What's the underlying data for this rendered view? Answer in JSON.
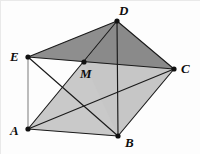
{
  "figure": {
    "width": 200,
    "height": 154,
    "background_color": "#fdfdfd",
    "stroke_color": "#1a1a1a",
    "fill_dark": "#8c8c8c",
    "fill_light": "#c4c4c4",
    "fill_white": "#ffffff",
    "vertices": [
      {
        "id": "A",
        "label": "A",
        "x": 28,
        "y": 129,
        "label_x": 10,
        "label_y": 124
      },
      {
        "id": "B",
        "label": "B",
        "x": 118,
        "y": 136,
        "label_x": 125,
        "label_y": 136
      },
      {
        "id": "C",
        "label": "C",
        "x": 174,
        "y": 69,
        "label_x": 181,
        "label_y": 62
      },
      {
        "id": "D",
        "label": "D",
        "x": 117,
        "y": 21,
        "label_x": 119,
        "label_y": 4
      },
      {
        "id": "E",
        "label": "E",
        "x": 28,
        "y": 57,
        "label_x": 10,
        "label_y": 50
      },
      {
        "id": "M",
        "label": "M",
        "x": 84,
        "y": 62,
        "label_x": 81,
        "label_y": 68
      }
    ],
    "edges": [
      {
        "from": "A",
        "to": "B",
        "name": "edge-ab"
      },
      {
        "from": "B",
        "to": "C",
        "name": "edge-bc"
      },
      {
        "from": "C",
        "to": "D",
        "name": "edge-cd"
      },
      {
        "from": "D",
        "to": "E",
        "name": "edge-de"
      },
      {
        "from": "E",
        "to": "A",
        "name": "edge-ea"
      },
      {
        "from": "A",
        "to": "C",
        "name": "diagonal-ac"
      },
      {
        "from": "A",
        "to": "D",
        "name": "diagonal-ad"
      },
      {
        "from": "E",
        "to": "C",
        "name": "diagonal-ec"
      },
      {
        "from": "E",
        "to": "B",
        "name": "diagonal-eb"
      },
      {
        "from": "D",
        "to": "B",
        "name": "diagonal-db"
      }
    ],
    "regions": [
      {
        "name": "region-edc-dark",
        "points": "28,57 117,21 174,69 84,62",
        "shade": "dark"
      },
      {
        "name": "region-lower-light",
        "points": "28,129 118,136 174,69 84,62",
        "shade": "light"
      },
      {
        "name": "region-dmc-dark",
        "points": "117,21 174,69 84,62",
        "shade": "dark"
      },
      {
        "name": "region-white-emx",
        "points": "28,57 84,62 52,89",
        "shade": "white"
      }
    ]
  }
}
